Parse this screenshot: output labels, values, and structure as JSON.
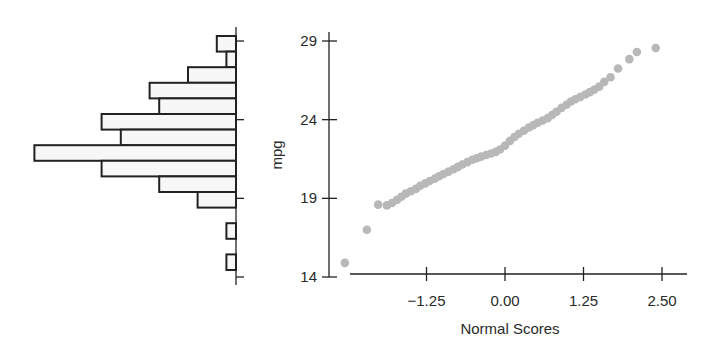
{
  "chart_data": [
    {
      "type": "bar",
      "orientation": "horizontal",
      "title": "",
      "description": "Marginal histogram of mpg (bars extend leftward from baseline)",
      "bins_top_to_bottom": [
        {
          "count": 2
        },
        {
          "count": 1
        },
        {
          "count": 5
        },
        {
          "count": 9
        },
        {
          "count": 8
        },
        {
          "count": 14
        },
        {
          "count": 12
        },
        {
          "count": 21
        },
        {
          "count": 14
        },
        {
          "count": 8
        },
        {
          "count": 4
        },
        {
          "count": 0
        },
        {
          "count": 1
        },
        {
          "count": 0
        },
        {
          "count": 1
        }
      ],
      "values": [
        2,
        1,
        5,
        9,
        8,
        14,
        12,
        21,
        14,
        8,
        4,
        0,
        1,
        0,
        1
      ],
      "axis_ticks_mpg": [
        29,
        24,
        19,
        14
      ],
      "ylim": [
        14,
        29.5
      ]
    },
    {
      "type": "scatter",
      "title": "",
      "xlabel": "Normal Scores",
      "ylabel": "mpg",
      "x_ticks": [
        "-1.25",
        "0.00",
        "1.25",
        "2.50"
      ],
      "y_ticks": [
        "14",
        "19",
        "24",
        "29"
      ],
      "xlim": [
        -2.5,
        2.9
      ],
      "ylim": [
        14,
        29.5
      ],
      "grid": false,
      "point_color": "#b8b8b8",
      "points": [
        [
          -2.55,
          14.9
        ],
        [
          -2.2,
          17.0
        ],
        [
          -2.02,
          18.6
        ],
        [
          -1.88,
          18.55
        ],
        [
          -1.8,
          18.7
        ],
        [
          -1.72,
          18.9
        ],
        [
          -1.65,
          19.1
        ],
        [
          -1.58,
          19.3
        ],
        [
          -1.5,
          19.45
        ],
        [
          -1.42,
          19.6
        ],
        [
          -1.35,
          19.8
        ],
        [
          -1.27,
          19.95
        ],
        [
          -1.2,
          20.1
        ],
        [
          -1.12,
          20.25
        ],
        [
          -1.05,
          20.4
        ],
        [
          -0.98,
          20.55
        ],
        [
          -0.9,
          20.7
        ],
        [
          -0.82,
          20.85
        ],
        [
          -0.75,
          21.0
        ],
        [
          -0.68,
          21.15
        ],
        [
          -0.6,
          21.3
        ],
        [
          -0.52,
          21.45
        ],
        [
          -0.45,
          21.55
        ],
        [
          -0.38,
          21.65
        ],
        [
          -0.3,
          21.75
        ],
        [
          -0.22,
          21.85
        ],
        [
          -0.15,
          21.95
        ],
        [
          -0.08,
          22.1
        ],
        [
          0.0,
          22.35
        ],
        [
          0.08,
          22.65
        ],
        [
          0.15,
          22.9
        ],
        [
          0.22,
          23.1
        ],
        [
          0.3,
          23.3
        ],
        [
          0.38,
          23.5
        ],
        [
          0.45,
          23.65
        ],
        [
          0.52,
          23.8
        ],
        [
          0.6,
          23.95
        ],
        [
          0.68,
          24.1
        ],
        [
          0.75,
          24.3
        ],
        [
          0.82,
          24.5
        ],
        [
          0.9,
          24.75
        ],
        [
          0.98,
          24.95
        ],
        [
          1.05,
          25.15
        ],
        [
          1.12,
          25.3
        ],
        [
          1.2,
          25.45
        ],
        [
          1.28,
          25.6
        ],
        [
          1.35,
          25.75
        ],
        [
          1.42,
          25.9
        ],
        [
          1.5,
          26.1
        ],
        [
          1.58,
          26.4
        ],
        [
          1.68,
          26.7
        ],
        [
          1.8,
          27.25
        ],
        [
          1.98,
          27.85
        ],
        [
          2.1,
          28.3
        ],
        [
          2.4,
          28.55
        ]
      ]
    }
  ],
  "labels": {
    "y_axis_title": "mpg",
    "x_axis_title": "Normal Scores"
  }
}
